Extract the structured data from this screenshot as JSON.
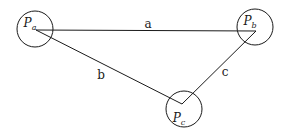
{
  "diagram": {
    "stroke_color": "#1a1a1a",
    "background": "#ffffff",
    "nodes": [
      {
        "id": "Pa",
        "label": "P",
        "subscript": "a",
        "cx": 35,
        "cy": 29,
        "r": 18,
        "anchor_x": 36,
        "anchor_y": 30
      },
      {
        "id": "Pb",
        "label": "P",
        "subscript": "b",
        "cx": 255,
        "cy": 27,
        "r": 18,
        "anchor_x": 256,
        "anchor_y": 31
      },
      {
        "id": "Pc",
        "label": "P",
        "subscript": "c",
        "cx": 184,
        "cy": 109,
        "r": 18,
        "anchor_x": 182,
        "anchor_y": 104
      }
    ],
    "edges": [
      {
        "id": "a",
        "label": "a",
        "from": "Pa",
        "to": "Pb",
        "label_x": 148,
        "label_y": 28
      },
      {
        "id": "b",
        "label": "b",
        "from": "Pa",
        "to": "Pc",
        "label_x": 101,
        "label_y": 79
      },
      {
        "id": "c",
        "label": "c",
        "from": "Pc",
        "to": "Pb",
        "label_x": 225,
        "label_y": 76
      }
    ]
  }
}
